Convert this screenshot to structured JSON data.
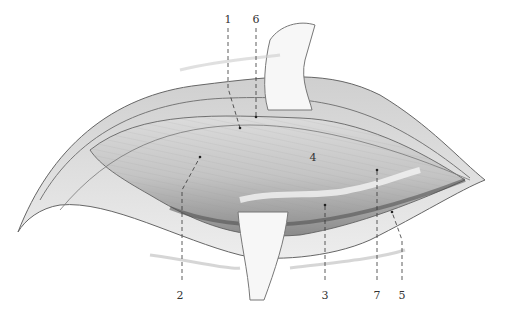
{
  "figure": {
    "labels": [
      {
        "id": "1",
        "text": "1",
        "x": 228,
        "y": 14,
        "line": [
          [
            228,
            28
          ],
          [
            228,
            88
          ],
          [
            240,
            128
          ]
        ]
      },
      {
        "id": "6",
        "text": "6",
        "x": 256,
        "y": 14,
        "line": [
          [
            256,
            28
          ],
          [
            256,
            117
          ]
        ]
      },
      {
        "id": "4",
        "text": "4",
        "x": 313,
        "y": 152,
        "line": []
      },
      {
        "id": "2",
        "text": "2",
        "x": 180,
        "y": 290,
        "line": [
          [
            182,
            280
          ],
          [
            182,
            190
          ],
          [
            200,
            157
          ]
        ]
      },
      {
        "id": "3",
        "text": "3",
        "x": 325,
        "y": 290,
        "line": [
          [
            325,
            280
          ],
          [
            325,
            205
          ]
        ]
      },
      {
        "id": "7",
        "text": "7",
        "x": 377,
        "y": 290,
        "line": [
          [
            377,
            280
          ],
          [
            377,
            170
          ]
        ]
      },
      {
        "id": "5",
        "text": "5",
        "x": 402,
        "y": 290,
        "line": [
          [
            402,
            280
          ],
          [
            402,
            240
          ],
          [
            392,
            212
          ]
        ]
      }
    ]
  },
  "colors": {
    "ink": "#333333",
    "tissue_light": "#e6e6e6",
    "tissue_mid": "#bdbdbd",
    "tissue_dark": "#7a7a7a",
    "retractor": "#f7f7f7"
  }
}
